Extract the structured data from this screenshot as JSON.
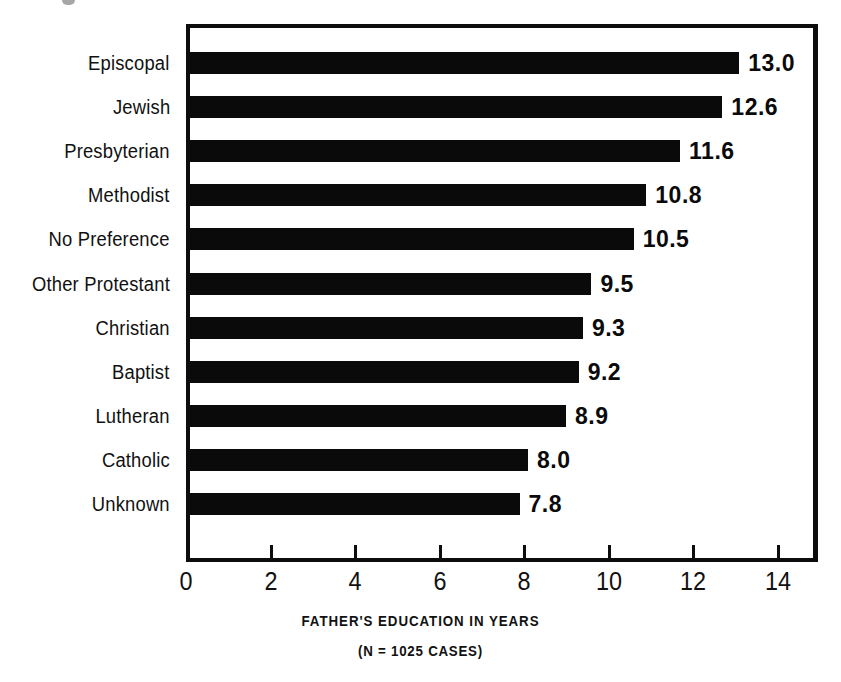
{
  "chart_data": {
    "type": "bar",
    "orientation": "horizontal",
    "title": "",
    "xlabel": "FATHER'S EDUCATION IN YEARS",
    "ylabel": "",
    "subtitle": "(N = 1025 CASES)",
    "categories": [
      "Episcopal",
      "Jewish",
      "Presbyterian",
      "Methodist",
      "No Preference",
      "Other Protestant",
      "Christian",
      "Baptist",
      "Lutheran",
      "Catholic",
      "Unknown"
    ],
    "values": [
      13.0,
      12.6,
      11.6,
      10.8,
      10.5,
      9.5,
      9.3,
      9.2,
      8.9,
      8.0,
      7.8
    ],
    "value_labels": [
      "13.0",
      "12.6",
      "11.6",
      "10.8",
      "10.5",
      "9.5",
      "9.3",
      "9.2",
      "8.9",
      "8.0",
      "7.8"
    ],
    "xlim": [
      0,
      15
    ],
    "xticks": [
      0,
      2,
      4,
      6,
      8,
      10,
      12,
      14
    ],
    "xtick_labels": [
      "0",
      "2",
      "4",
      "6",
      "8",
      "10",
      "12",
      "14"
    ],
    "grid": false,
    "legend": "none",
    "bar_color": "#0a0a0a",
    "background_color": "#ffffff",
    "frame_color": "#0d0d0d"
  },
  "axis": {
    "x_title": "FATHER'S EDUCATION IN YEARS",
    "sample_note": "(N = 1025 CASES)"
  }
}
